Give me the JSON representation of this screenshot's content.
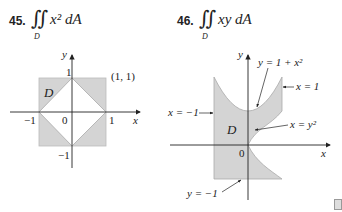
{
  "problems": [
    {
      "number": "45.",
      "integral": "∬",
      "region": "D",
      "integrand": "x² dA"
    },
    {
      "number": "46.",
      "integral": "∬",
      "region": "D",
      "integrand": "xy dA"
    }
  ],
  "figure45": {
    "axis_x": "x",
    "axis_y": "y",
    "ticks": {
      "x_pos": "1",
      "x_neg": "−1",
      "y_pos": "1",
      "y_neg": "−1",
      "origin": "0"
    },
    "corner_label": "(1, 1)",
    "region_label": "D",
    "fill_color": "#d4d4d4"
  },
  "figure46": {
    "axis_x": "x",
    "axis_y": "y",
    "origin": "0",
    "region_label": "D",
    "curves": {
      "top": "y = 1 + x²",
      "right": "x = 1",
      "left": "x = −1",
      "parabola": "x = y²",
      "bottom": "y = −1"
    },
    "fill_color": "#d4d4d4"
  }
}
